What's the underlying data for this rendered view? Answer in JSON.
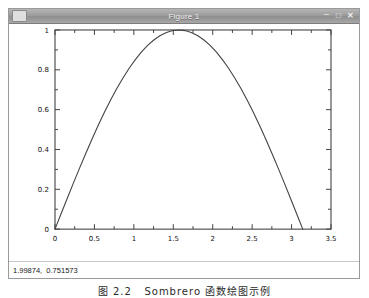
{
  "window": {
    "title": "Figure 1",
    "icon": "window-menu-icon",
    "controls": [
      {
        "name": "minimize-button",
        "glyph": "–"
      },
      {
        "name": "maximize-button",
        "glyph": "□"
      },
      {
        "name": "close-button",
        "glyph": "✕"
      }
    ]
  },
  "status": {
    "coordinates": "1.99874,  0.751573",
    "x_value": "1.99874",
    "y_value": "0.751573"
  },
  "caption": "图 2.2   Sombrero 函数绘图示例",
  "colors": {
    "curve": "#444444",
    "axis": "#444444",
    "titlebar": "#9d9d9d",
    "plot_background": "#ffffff",
    "text": "#111111"
  },
  "chart_data": {
    "type": "line",
    "title": "",
    "xlabel": "",
    "ylabel": "",
    "xlim": [
      0,
      3.5
    ],
    "ylim": [
      0,
      1
    ],
    "grid": false,
    "legend": false,
    "xticks": [
      0,
      0.5,
      1,
      1.5,
      2,
      2.5,
      3,
      3.5
    ],
    "xticklabels": [
      "0",
      "0.5",
      "1",
      "1.5",
      "2",
      "2.5",
      "3",
      "3.5"
    ],
    "yticks": [
      0,
      0.2,
      0.4,
      0.6,
      0.8,
      1
    ],
    "yticklabels": [
      "0",
      "0.2",
      "0.4",
      "0.6",
      "0.8",
      "1"
    ],
    "series": [
      {
        "name": "sin(x)",
        "x": [
          0.0,
          0.0785,
          0.1571,
          0.2356,
          0.3142,
          0.3927,
          0.4712,
          0.5498,
          0.6283,
          0.7069,
          0.7854,
          0.8639,
          0.9425,
          1.021,
          1.0996,
          1.1781,
          1.2566,
          1.3352,
          1.4137,
          1.4923,
          1.5708,
          1.6493,
          1.7279,
          1.8064,
          1.885,
          1.9635,
          2.042,
          2.1206,
          2.1991,
          2.2777,
          2.3562,
          2.4347,
          2.5133,
          2.5918,
          2.6704,
          2.7489,
          2.8274,
          2.906,
          2.9845,
          3.0631,
          3.1416
        ],
        "y": [
          0.0,
          0.0785,
          0.1564,
          0.2334,
          0.309,
          0.3827,
          0.454,
          0.5225,
          0.5878,
          0.6494,
          0.7071,
          0.7604,
          0.809,
          0.8526,
          0.891,
          0.9239,
          0.9511,
          0.9724,
          0.9877,
          0.9969,
          1.0,
          0.9969,
          0.9877,
          0.9724,
          0.9511,
          0.9239,
          0.891,
          0.8526,
          0.809,
          0.7604,
          0.7071,
          0.6494,
          0.5878,
          0.5225,
          0.454,
          0.3827,
          0.309,
          0.2334,
          0.1564,
          0.0785,
          0.0
        ]
      }
    ]
  }
}
